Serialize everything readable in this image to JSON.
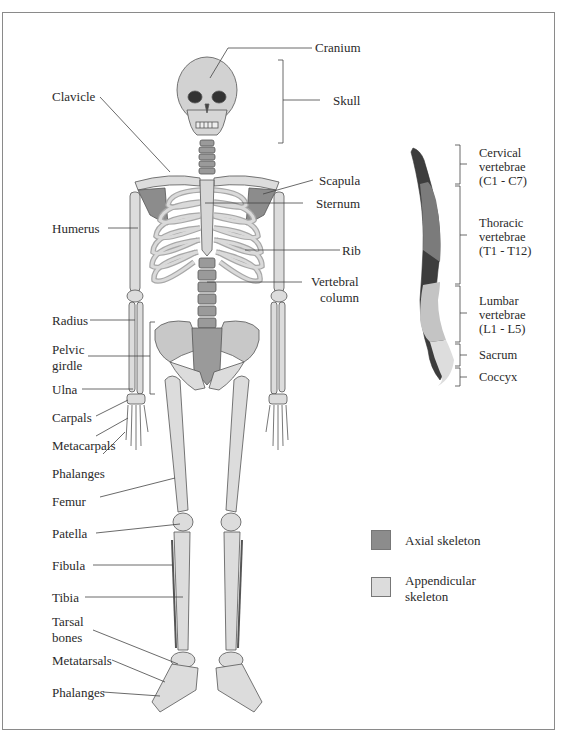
{
  "colors": {
    "axial": "#8c8c8c",
    "appendicular": "#dcdcdc",
    "outline": "#555555",
    "leader": "#444444",
    "frame": "#8a8a8a"
  },
  "labels_left": {
    "clavicle": "Clavicle",
    "humerus": "Humerus",
    "radius": "Radius",
    "pelvic_girdle_1": "Pelvic",
    "pelvic_girdle_2": "girdle",
    "ulna": "Ulna",
    "carpals": "Carpals",
    "metacarpals": "Metacarpals",
    "phalanges_hand": "Phalanges",
    "femur": "Femur",
    "patella": "Patella",
    "fibula": "Fibula",
    "tibia": "Tibia",
    "tarsal_1": "Tarsal",
    "tarsal_2": "bones",
    "metatarsals": "Metatarsals",
    "phalanges_foot": "Phalanges"
  },
  "labels_right": {
    "cranium": "Cranium",
    "skull": "Skull",
    "scapula": "Scapula",
    "sternum": "Sternum",
    "rib": "Rib",
    "vertebral_1": "Vertebral",
    "vertebral_2": "column"
  },
  "spine_inset": {
    "regions": [
      {
        "lines": [
          "Cervical",
          "vertebrae",
          "(C1 - C7)"
        ]
      },
      {
        "lines": [
          "Thoracic",
          "vertebrae",
          "(T1 - T12)"
        ]
      },
      {
        "lines": [
          "Lumbar",
          "vertebrae",
          "(L1 - L5)"
        ]
      },
      {
        "lines": [
          "Sacrum"
        ]
      },
      {
        "lines": [
          "Coccyx"
        ]
      }
    ],
    "numbers": {
      "cervical": [
        "1",
        "2",
        "3",
        "4",
        "5",
        "6",
        "7"
      ],
      "thoracic": [
        "1",
        "2",
        "3",
        "4",
        "5",
        "6",
        "7",
        "8",
        "9",
        "10",
        "11",
        "12"
      ],
      "lumbar": [
        "1",
        "2",
        "3",
        "4",
        "5"
      ]
    }
  },
  "legend": {
    "axial": "Axial skeleton",
    "appendicular_1": "Appendicular",
    "appendicular_2": "skeleton"
  }
}
